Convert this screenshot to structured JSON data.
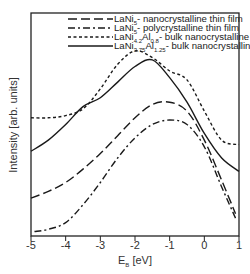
{
  "chart_data": {
    "type": "line",
    "title": "",
    "xlabel": "E_B [eV]",
    "ylabel": "Intensity [arb. units]",
    "xlim": [
      -5,
      1
    ],
    "ylim": [
      0,
      1
    ],
    "x_ticks": [
      "-5",
      "-4",
      "-3",
      "-2",
      "-1",
      "0",
      "1"
    ],
    "grid": false,
    "legend_position": "upper right",
    "series": [
      {
        "name": "LaNi5- nanocrystalline thin film",
        "style": "dashed",
        "x": [
          -5.0,
          -4.5,
          -4.0,
          -3.5,
          -3.0,
          -2.5,
          -2.0,
          -1.5,
          -1.0,
          -0.5,
          0.0,
          0.5,
          0.9
        ],
        "y": [
          0.17,
          0.2,
          0.24,
          0.3,
          0.37,
          0.45,
          0.53,
          0.59,
          0.6,
          0.56,
          0.43,
          0.25,
          0.1
        ]
      },
      {
        "name": "LaNi5- polycrystalline thin film",
        "style": "dash-dot",
        "x": [
          -4.9,
          -4.5,
          -4.0,
          -3.5,
          -3.0,
          -2.5,
          -2.0,
          -1.5,
          -1.0,
          -0.5,
          0.0,
          0.5,
          0.9
        ],
        "y": [
          0.02,
          0.03,
          0.06,
          0.14,
          0.24,
          0.35,
          0.44,
          0.5,
          0.52,
          0.5,
          0.4,
          0.22,
          0.08
        ]
      },
      {
        "name": "LaNi4.2Al0.8- bulk nanocrystalline",
        "style": "dotted",
        "x": [
          -5.0,
          -4.5,
          -4.0,
          -3.5,
          -3.0,
          -2.5,
          -2.0,
          -1.5,
          -1.0,
          -0.5,
          0.0,
          0.5,
          1.0
        ],
        "y": [
          0.53,
          0.53,
          0.54,
          0.57,
          0.66,
          0.77,
          0.83,
          0.8,
          0.74,
          0.7,
          0.56,
          0.43,
          0.41
        ]
      },
      {
        "name": "LaNi3.75Al1.25- bulk nanocrystalline",
        "style": "solid",
        "x": [
          -5.0,
          -4.5,
          -4.0,
          -3.5,
          -3.0,
          -2.5,
          -2.0,
          -1.5,
          -1.0,
          -0.5,
          0.0,
          0.5,
          1.0
        ],
        "y": [
          0.38,
          0.43,
          0.5,
          0.58,
          0.62,
          0.69,
          0.76,
          0.79,
          0.71,
          0.6,
          0.46,
          0.35,
          0.29
        ]
      }
    ]
  },
  "legend": [
    {
      "label_main": "LaNi",
      "sub1": "5",
      "mid": "",
      "sub2": "",
      "rest": "- nanocrystalline thin film"
    },
    {
      "label_main": "LaNi",
      "sub1": "5",
      "mid": "",
      "sub2": "",
      "rest": "- polycrystalline thin film"
    },
    {
      "label_main": "LaNi",
      "sub1": "4.2",
      "mid": "Al",
      "sub2": "0.8",
      "rest": "- bulk nanocrystalline"
    },
    {
      "label_main": "LaNi",
      "sub1": "3.75",
      "mid": "Al",
      "sub2": "1.25",
      "rest": "- bulk nanocrystalline"
    }
  ],
  "axes": {
    "xlabel_main": "E",
    "xlabel_sub": "B",
    "xlabel_rest": " [eV]",
    "ylabel": "Intensity [arb. units]"
  }
}
